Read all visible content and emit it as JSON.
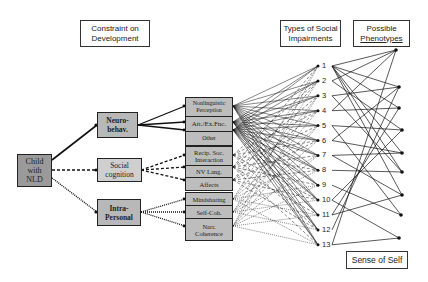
{
  "headers": {
    "constraint": [
      "Constraint on",
      "Development"
    ],
    "types": [
      "Types of Social",
      "Impairments"
    ],
    "phenotypes": [
      "Possible",
      "Phenotypes"
    ],
    "sense_of_self": "Sense of Self"
  },
  "root": {
    "lines": [
      "Child",
      "with",
      "NLD"
    ]
  },
  "constraints": [
    {
      "id": "neuro",
      "lines": [
        "Neuro-",
        "behav."
      ],
      "style": "solid"
    },
    {
      "id": "social",
      "lines": [
        "Social",
        "cognition"
      ],
      "style": "dashed"
    },
    {
      "id": "intra",
      "lines": [
        "Intra-",
        "Personal"
      ],
      "style": "dotted"
    }
  ],
  "subdomains": [
    {
      "group": "neuro",
      "items": [
        [
          "Nonlinguistic",
          "Perception"
        ],
        [
          "Att./Ex.Fnc."
        ],
        [
          "Other"
        ]
      ]
    },
    {
      "group": "social",
      "items": [
        [
          "Recip. Soc.",
          "Interaction"
        ],
        [
          "NV Lang."
        ],
        [
          "Affects"
        ]
      ]
    },
    {
      "group": "intra",
      "items": [
        [
          "Mindsharing"
        ],
        [
          "Self-Coh."
        ],
        [
          "Narr.",
          "Coherence"
        ]
      ]
    }
  ],
  "impairment_numbers": [
    "1",
    "2",
    "3",
    "4",
    "5",
    "6",
    "7",
    "8",
    "9",
    "10",
    "11",
    "12",
    "13"
  ],
  "phenotype_count": 9
}
